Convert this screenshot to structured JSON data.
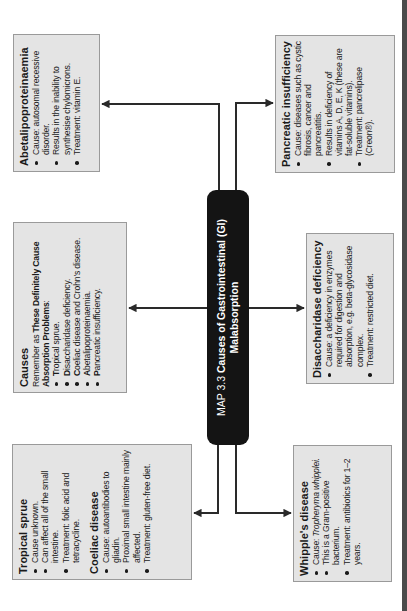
{
  "map": {
    "number": "MAP 3.3",
    "title_line1": "Causes of Gastrointestinal (GI)",
    "title_line2": "Malabsorption"
  },
  "boxes": {
    "abetalipoproteinaemia": {
      "title": "Abetalipoproteinaemia",
      "items": [
        "Cause: autosomal recessive disorder.",
        "Results in the inability to synthesise chylomicrons.",
        "Treatment: vitamin E."
      ]
    },
    "pancreatic": {
      "title": "Pancreatic insufficiency",
      "items": [
        "Cause: diseases such as cystic fibrosis, cancer and pancreatitis.",
        "Results in deficiency of vitamins A, D, E, K (these are fat-soluble vitamins).",
        "Treatment: pancrelipase (Creon®)."
      ]
    },
    "causes": {
      "title": "Causes",
      "intro_prefix": "Remember as ",
      "intro_bold": "These Definitely Cause Absorption Problems",
      "intro_suffix": ":",
      "items": [
        {
          "initial": "T",
          "rest": "ropical sprue."
        },
        {
          "initial": "D",
          "rest": "isaccharidase deficiency."
        },
        {
          "initial": "C",
          "rest": "oeliac disease and Crohn's disease."
        },
        {
          "initial": "A",
          "rest": "betalipoproteinaemia."
        },
        {
          "initial": "P",
          "rest": "ancreatic insufficiency."
        }
      ]
    },
    "disaccharidase": {
      "title": "Disaccharidase deficiency",
      "items": [
        "Cause: a deficiency in enzymes required for digestion and absorption, e.g. beta-glycosidase complex.",
        "Treatment: restricted diet."
      ]
    },
    "tropical": {
      "title": "Tropical sprue",
      "items": [
        "Cause unknown.",
        "Can affect all of the small intestine.",
        "Treatment: folic acid and tetracycline."
      ],
      "coeliac_title": "Coeliac disease",
      "coeliac_items": [
        "Cause: autoantibodies to gliadin.",
        "Proximal small intestine mainly affected.",
        "Treatment: gluten-free diet."
      ]
    },
    "whipple": {
      "title": "Whipple's disease",
      "cause_prefix": "Cause: ",
      "cause_italic": "Tropheryma whipplei.",
      "items": [
        "This is a Gram-positive bacterium.",
        "Treatment: antibiotics for 1–2 years."
      ]
    }
  },
  "colors": {
    "box_fill": "#e4e4e4",
    "box_border": "#9a9a9a",
    "center_fill": "#141414",
    "arrow": "#2a2a2a"
  }
}
